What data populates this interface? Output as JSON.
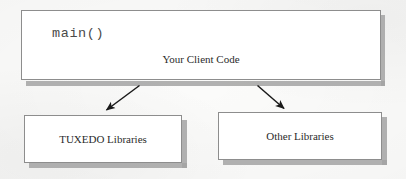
{
  "diagram": {
    "background_color": "#fbfbfa",
    "box_fill": "#ffffff",
    "box_border_color": "#8d8d8d",
    "shadow_color": "#a3a3a3",
    "text_color": "#2b2b2b",
    "code_text_color": "#4a4a4a",
    "nodes": [
      {
        "id": "client",
        "code_label": "main()",
        "label": "Your Client Code"
      },
      {
        "id": "tuxedo",
        "label": "TUXEDO Libraries"
      },
      {
        "id": "other",
        "label": "Other Libraries"
      }
    ],
    "connectors": [
      {
        "id": "client-to-tuxedo",
        "from": "client",
        "to": "tuxedo",
        "style": "solid-arrow",
        "direction": "down-left"
      },
      {
        "id": "client-to-other",
        "from": "client",
        "to": "other",
        "style": "solid-arrow",
        "direction": "down-right"
      }
    ]
  }
}
